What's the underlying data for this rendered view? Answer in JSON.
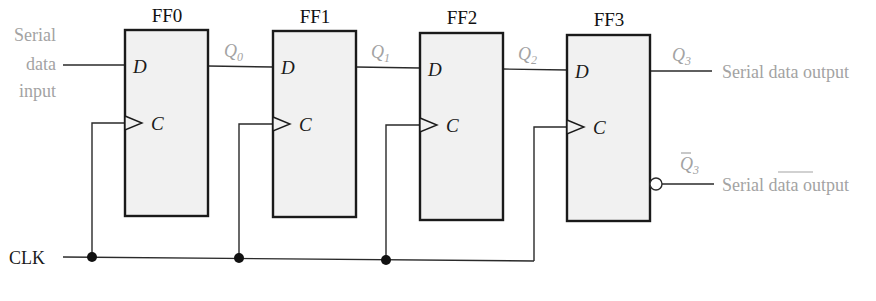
{
  "diagram": {
    "type": "serial-in serial-out shift register",
    "flip_flops": [
      {
        "name": "FF0",
        "d_pin": "D",
        "c_pin": "C",
        "output": "Q",
        "output_sub": "0"
      },
      {
        "name": "FF1",
        "d_pin": "D",
        "c_pin": "C",
        "output": "Q",
        "output_sub": "1"
      },
      {
        "name": "FF2",
        "d_pin": "D",
        "c_pin": "C",
        "output": "Q",
        "output_sub": "2"
      },
      {
        "name": "FF3",
        "d_pin": "D",
        "c_pin": "C",
        "output": "Q",
        "output_sub": "3"
      }
    ],
    "input_label": [
      "Serial",
      "data",
      "input"
    ],
    "output_label": "Serial data output",
    "inverted_output": {
      "symbol": "Q",
      "sub": "3",
      "label_pre": "Serial ",
      "label_overbar": "data",
      "label_post": " output"
    },
    "clock_label": "CLK",
    "colors": {
      "box_fill": "#f1f1f1",
      "stroke": "#1a1a1a",
      "signal_label": "#a3a3a3"
    }
  }
}
